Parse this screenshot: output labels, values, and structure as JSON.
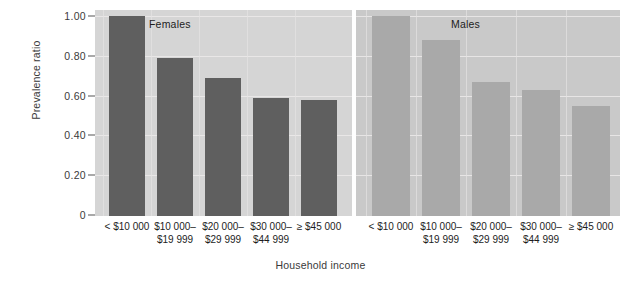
{
  "chart_data": {
    "type": "bar",
    "title": "",
    "xlabel": "Household income",
    "ylabel": "Prevalence ratio",
    "ylim": [
      0,
      1.05
    ],
    "grid": true,
    "legend_position": "none",
    "panel_layout": "side-by-side",
    "y_ticks": [
      "0",
      "0.20",
      "0.40",
      "0.60",
      "0.80",
      "1.00"
    ],
    "y_tick_values": [
      0,
      0.2,
      0.4,
      0.6,
      0.8,
      1.0
    ],
    "categories": [
      "< $10 000",
      "$10 000–\n$19 999",
      "$20 000–\n$29 999",
      "$30 000–\n$44 999",
      "≥ $45 000"
    ],
    "panels": [
      {
        "name": "Females",
        "color": "#5f5f5f",
        "values": [
          1.0,
          0.79,
          0.69,
          0.59,
          0.58
        ]
      },
      {
        "name": "Males",
        "color": "#a9a9a9",
        "values": [
          1.0,
          0.88,
          0.67,
          0.63,
          0.55
        ]
      }
    ],
    "series": [
      {
        "name": "Females",
        "values": [
          1.0,
          0.79,
          0.69,
          0.59,
          0.58
        ]
      },
      {
        "name": "Males",
        "values": [
          1.0,
          0.88,
          0.67,
          0.63,
          0.55
        ]
      }
    ]
  }
}
